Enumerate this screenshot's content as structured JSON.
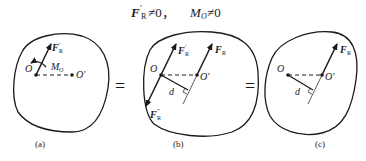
{
  "title": {
    "F": "F",
    "prime": "′",
    "sub_R": "R",
    "neq1": "≠0，",
    "M": "M",
    "sub_O": "O",
    "neq2": "≠0"
  },
  "equals": [
    "=",
    "="
  ],
  "panels": [
    {
      "id": "a",
      "caption": "(a)",
      "point_O": "O",
      "point_O_prime": "O′",
      "force_label": {
        "F": "F",
        "prime": "′",
        "sub": "R"
      },
      "moment_label": {
        "M": "M",
        "sub": "O"
      }
    },
    {
      "id": "b",
      "caption": "(b)",
      "point_O": "O",
      "point_O_prime": "O′",
      "force_label_1": {
        "F": "F",
        "prime": "′",
        "sub": "R"
      },
      "force_label_2": {
        "F": "F",
        "sub": "R"
      },
      "force_label_3": {
        "F": "F",
        "prime": "″",
        "sub": "R"
      },
      "distance_label": "d"
    },
    {
      "id": "c",
      "caption": "(c)",
      "point_O": "O",
      "point_O_prime": "O′",
      "force_label": {
        "F": "F",
        "sub": "R"
      },
      "distance_label": "d"
    }
  ],
  "colors": {
    "ink": "#1a1a1a",
    "background": "#ffffff"
  }
}
